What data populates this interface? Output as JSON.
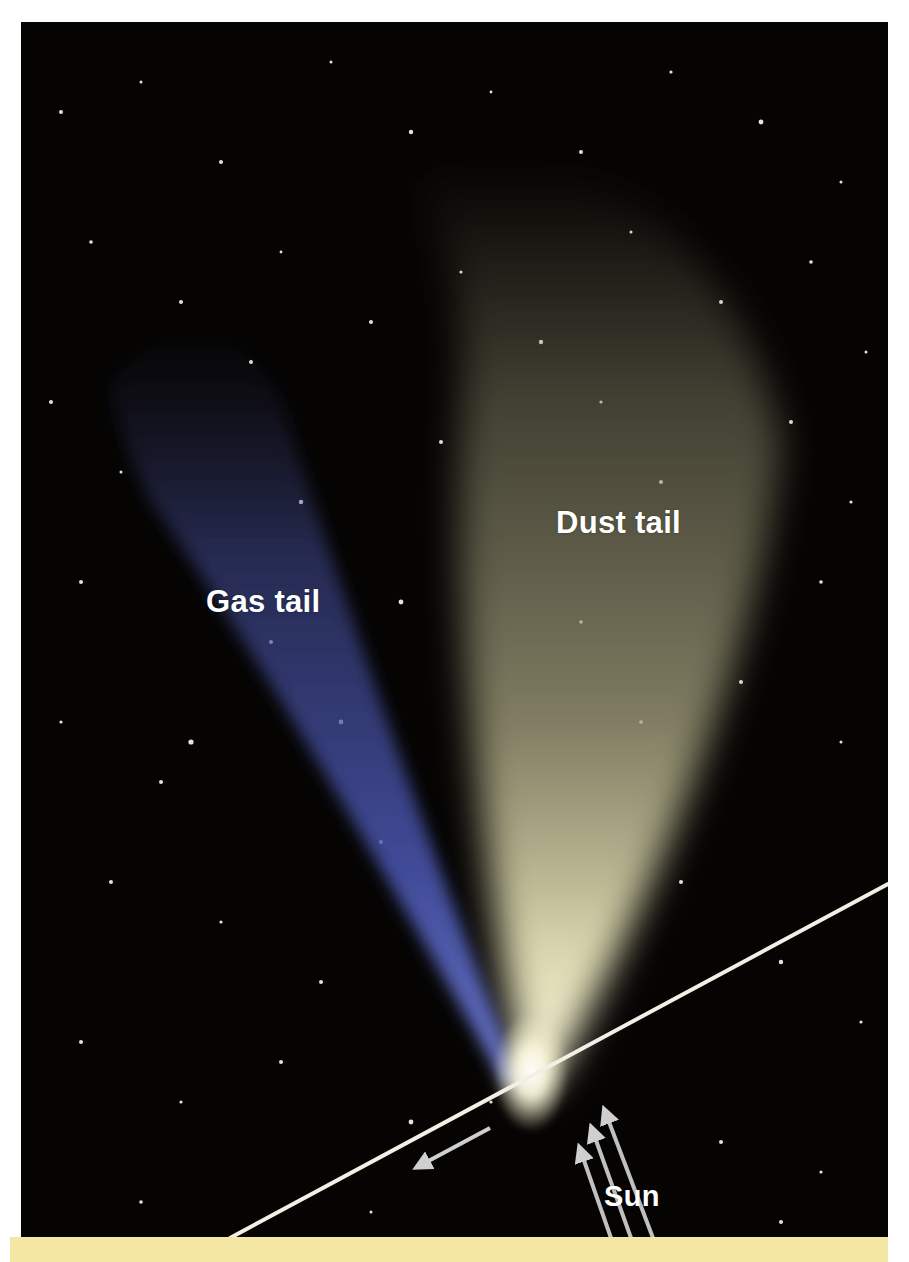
{
  "figure": {
    "labels": {
      "gas_tail": "Gas tail",
      "dust_tail": "Dust tail",
      "sun": "Sun"
    },
    "colors": {
      "sky": "#050403",
      "gas_tail": "#4a56a8",
      "dust_tail": "#c9c59a",
      "nucleus": "#fffbe0",
      "orbit_line": "#f2efe4",
      "arrows": "#c8c8c8",
      "strip": "#f4e7a4"
    }
  }
}
